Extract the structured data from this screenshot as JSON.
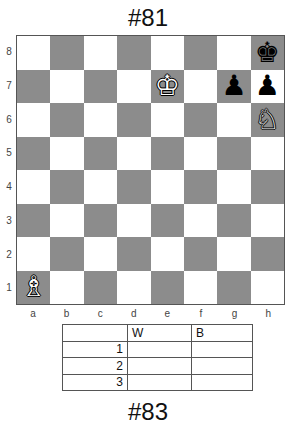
{
  "top_title": "#81",
  "bottom_title": "#83",
  "colors": {
    "light_square": "#ffffff",
    "dark_square": "#8c8c8c"
  },
  "ranks": [
    "8",
    "7",
    "6",
    "5",
    "4",
    "3",
    "2",
    "1"
  ],
  "files": [
    "a",
    "b",
    "c",
    "d",
    "e",
    "f",
    "g",
    "h"
  ],
  "pieces": [
    {
      "square": "h8",
      "color": "black",
      "type": "king",
      "glyph": "♚"
    },
    {
      "square": "e7",
      "color": "white",
      "type": "king",
      "glyph": "♔"
    },
    {
      "square": "g7",
      "color": "black",
      "type": "pawn",
      "glyph": "♟"
    },
    {
      "square": "h7",
      "color": "black",
      "type": "pawn",
      "glyph": "♟"
    },
    {
      "square": "h6",
      "color": "white",
      "type": "knight",
      "glyph": "♘"
    },
    {
      "square": "a1",
      "color": "white",
      "type": "bishop",
      "glyph": "♗"
    }
  ],
  "score_table": {
    "headers": [
      "",
      "W",
      "B"
    ],
    "rows": [
      {
        "move": "1",
        "white": "",
        "black": ""
      },
      {
        "move": "2",
        "white": "",
        "black": ""
      },
      {
        "move": "3",
        "white": "",
        "black": ""
      }
    ]
  }
}
